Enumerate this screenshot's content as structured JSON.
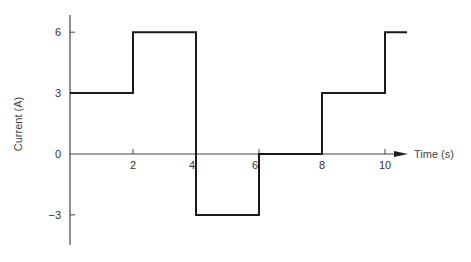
{
  "chart_data": {
    "type": "line",
    "style": "step",
    "title": "",
    "xlabel": "Time (s)",
    "ylabel": "Current (A)",
    "xlim": [
      0,
      10.7
    ],
    "ylim": [
      -4.5,
      7
    ],
    "x_ticks": [
      2,
      4,
      6,
      8,
      10
    ],
    "x_tick_labels": [
      "2",
      "4",
      "6",
      "8",
      "10"
    ],
    "y_ticks": [
      6,
      3,
      0,
      -3
    ],
    "y_tick_labels": [
      "6",
      "3",
      "0",
      "−3"
    ],
    "grid": false,
    "legend": null,
    "series": [
      {
        "name": "current",
        "segments": [
          {
            "t_start": 0,
            "t_end": 2,
            "value": 3
          },
          {
            "t_start": 2,
            "t_end": 4,
            "value": 6
          },
          {
            "t_start": 4,
            "t_end": 6,
            "value": -3
          },
          {
            "t_start": 6,
            "t_end": 8,
            "value": 0
          },
          {
            "t_start": 8,
            "t_end": 10,
            "value": 3
          },
          {
            "t_start": 10,
            "t_end": 10.7,
            "value": 6
          }
        ],
        "x": [
          0,
          2,
          2,
          4,
          4,
          6,
          6,
          8,
          8,
          10,
          10,
          10.7
        ],
        "y": [
          3,
          3,
          6,
          6,
          -3,
          -3,
          0,
          0,
          3,
          3,
          6,
          6
        ]
      }
    ]
  },
  "layout": {
    "origin_px": [
      70,
      154
    ],
    "px_per_x": 31.5,
    "px_per_y": 20.3,
    "y_axis_top_px": 15,
    "y_axis_bottom_px": 245,
    "x_axis_end_px": 408
  },
  "colors": {
    "line": "#1a1a1a",
    "axis": "#444444",
    "text": "#333333"
  }
}
